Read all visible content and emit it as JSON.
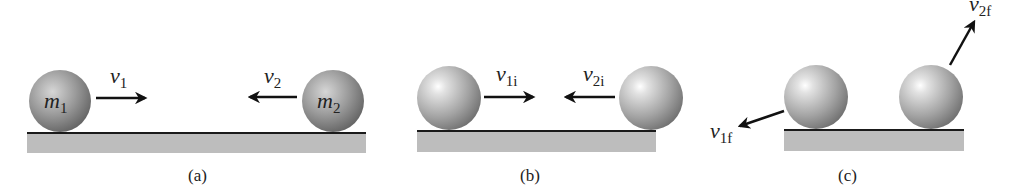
{
  "figure": {
    "panels": [
      {
        "caption": "(a)",
        "ball1_label": {
          "base": "m",
          "sub": "1"
        },
        "ball2_label": {
          "base": "m",
          "sub": "2"
        },
        "v_left": {
          "base": "v",
          "sub": "1"
        },
        "v_right": {
          "base": "v",
          "sub": "2"
        }
      },
      {
        "caption": "(b)",
        "v_left": {
          "base": "v",
          "sub": "1i"
        },
        "v_right": {
          "base": "v",
          "sub": "2i"
        }
      },
      {
        "caption": "(c)",
        "v_left": {
          "base": "v",
          "sub": "1f"
        },
        "v_right": {
          "base": "v",
          "sub": "2f"
        }
      }
    ],
    "colors": {
      "floor": "#bdbdbd",
      "floor_line": "#1a1a1a",
      "ball_light": "#f4f4f4",
      "ball_mid": "#a8a8a8",
      "ball_dark": "#5e5e5e",
      "arrow": "#111111"
    }
  }
}
